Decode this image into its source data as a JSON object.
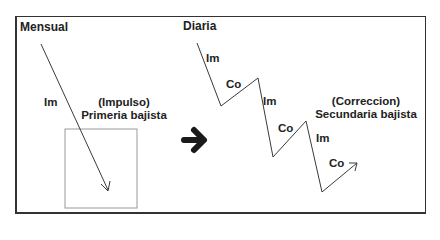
{
  "colors": {
    "frame": "#333333",
    "line": "#3a3a3a",
    "inner_box": "#999999",
    "big_arrow": "#1a1a1a",
    "text": "#222222"
  },
  "left_panel": {
    "title": "Mensual",
    "wave_label": "Im",
    "caption_line1": "(Impulso)",
    "caption_line2": "Primeria bajista",
    "arrow": {
      "from": [
        41,
        44
      ],
      "to": [
        108,
        190
      ]
    },
    "inner_box": {
      "x": 65,
      "y": 129,
      "w": 72,
      "h": 79
    }
  },
  "transition_icon": "right-arrow-icon",
  "right_panel": {
    "title": "Diaria",
    "caption_line1": "(Correccion)",
    "caption_line2": "Secundaria bajista",
    "zigzag_points": [
      [
        197,
        43
      ],
      [
        221,
        106
      ],
      [
        258,
        78
      ],
      [
        273,
        157
      ],
      [
        306,
        121
      ],
      [
        322,
        192
      ],
      [
        357,
        163
      ]
    ],
    "wave_labels": [
      "Im",
      "Co",
      "Im",
      "Co",
      "Im",
      "Co"
    ]
  }
}
